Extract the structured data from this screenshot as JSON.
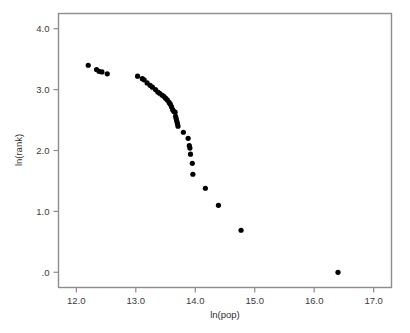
{
  "chart_data": {
    "type": "scatter",
    "title": "",
    "xlabel": "ln(pop)",
    "ylabel": "ln(rank)",
    "xlim": [
      11.7,
      17.3
    ],
    "ylim": [
      -0.25,
      4.25
    ],
    "xticks": [
      12.0,
      13.0,
      14.0,
      15.0,
      16.0,
      17.0
    ],
    "xticklabels": [
      "12.0",
      "13.0",
      "14.0",
      "15.0",
      "16.0",
      "17.0"
    ],
    "yticks": [
      0.0,
      1.0,
      2.0,
      3.0,
      4.0
    ],
    "yticklabels": [
      ".0",
      "1.0",
      "2.0",
      "3.0",
      "4.0"
    ],
    "grid": false,
    "legend": null,
    "marker": "filled-circle",
    "marker_color": "#000000",
    "marker_size_px": 5.2,
    "n_points": 41,
    "points": [
      {
        "x": 12.2,
        "y": 3.4
      },
      {
        "x": 12.34,
        "y": 3.33
      },
      {
        "x": 12.38,
        "y": 3.3
      },
      {
        "x": 12.43,
        "y": 3.29
      },
      {
        "x": 12.52,
        "y": 3.26
      },
      {
        "x": 13.03,
        "y": 3.22
      },
      {
        "x": 13.11,
        "y": 3.18
      },
      {
        "x": 13.14,
        "y": 3.16
      },
      {
        "x": 13.19,
        "y": 3.11
      },
      {
        "x": 13.24,
        "y": 3.07
      },
      {
        "x": 13.28,
        "y": 3.04
      },
      {
        "x": 13.33,
        "y": 3.0
      },
      {
        "x": 13.37,
        "y": 2.96
      },
      {
        "x": 13.4,
        "y": 2.94
      },
      {
        "x": 13.44,
        "y": 2.91
      },
      {
        "x": 13.47,
        "y": 2.89
      },
      {
        "x": 13.5,
        "y": 2.86
      },
      {
        "x": 13.53,
        "y": 2.83
      },
      {
        "x": 13.56,
        "y": 2.79
      },
      {
        "x": 13.58,
        "y": 2.76
      },
      {
        "x": 13.6,
        "y": 2.72
      },
      {
        "x": 13.62,
        "y": 2.67
      },
      {
        "x": 13.64,
        "y": 2.64
      },
      {
        "x": 13.66,
        "y": 2.63
      },
      {
        "x": 13.67,
        "y": 2.56
      },
      {
        "x": 13.68,
        "y": 2.52
      },
      {
        "x": 13.69,
        "y": 2.48
      },
      {
        "x": 13.7,
        "y": 2.44
      },
      {
        "x": 13.71,
        "y": 2.4
      },
      {
        "x": 13.8,
        "y": 2.3
      },
      {
        "x": 13.88,
        "y": 2.2
      },
      {
        "x": 13.9,
        "y": 2.08
      },
      {
        "x": 13.91,
        "y": 2.04
      },
      {
        "x": 13.92,
        "y": 1.94
      },
      {
        "x": 13.95,
        "y": 1.79
      },
      {
        "x": 13.96,
        "y": 1.61
      },
      {
        "x": 14.17,
        "y": 1.38
      },
      {
        "x": 14.39,
        "y": 1.1
      },
      {
        "x": 14.77,
        "y": 0.69
      },
      {
        "x": 16.4,
        "y": 0.0
      }
    ]
  },
  "axes": {
    "frame_color": "#8d8d8d",
    "background": "#ffffff"
  }
}
